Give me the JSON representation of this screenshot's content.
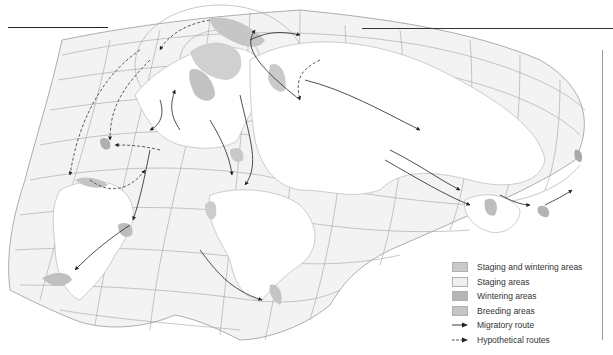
{
  "map": {
    "title": "",
    "colors": {
      "ocean_grid": "#f1f1f1",
      "grid_line": "#9a9a9a",
      "land": "#ffffff",
      "coast": "#b8b8b8",
      "staging_and_wintering": "#c8c8c8",
      "staging": "#ececec",
      "wintering": "#b4b4b4",
      "breeding": "#c4c4c4",
      "route": "#222222"
    }
  },
  "legend": {
    "items": [
      {
        "type": "swatch",
        "label": "Staging and wintering areas",
        "color": "#cbcbcb"
      },
      {
        "type": "swatch",
        "label": "Staging areas",
        "color": "#efefef"
      },
      {
        "type": "swatch",
        "label": "Wintering areas",
        "color": "#b6b6b6"
      },
      {
        "type": "swatch",
        "label": "Breeding areas",
        "color": "#c6c6c6"
      },
      {
        "type": "solid-arrow",
        "label": "Migratory route"
      },
      {
        "type": "dashed-arrow",
        "label": "Hypothetical routes"
      }
    ]
  }
}
